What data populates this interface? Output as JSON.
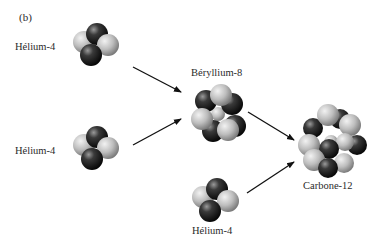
{
  "figure": {
    "panel_label": "(b)"
  },
  "nodes": [
    {
      "id": "he4_a",
      "label": "Hélium-4",
      "protons": 2,
      "neutrons": 2
    },
    {
      "id": "he4_b",
      "label": "Hélium-4",
      "protons": 2,
      "neutrons": 2
    },
    {
      "id": "be8",
      "label": "Béryllium-8",
      "protons": 4,
      "neutrons": 4
    },
    {
      "id": "he4_c",
      "label": "Hélium-4",
      "protons": 2,
      "neutrons": 2
    },
    {
      "id": "c12",
      "label": "Carbone-12",
      "protons": 6,
      "neutrons": 6
    }
  ],
  "edges": [
    {
      "from": "he4_a",
      "to": "be8"
    },
    {
      "from": "he4_b",
      "to": "be8"
    },
    {
      "from": "be8",
      "to": "c12"
    },
    {
      "from": "he4_c",
      "to": "c12"
    }
  ],
  "colors": {
    "proton_light": "#c8c8c8",
    "neutron_dark": "#1e1e1e",
    "arrow": "#111111",
    "text": "#2a2a2a"
  }
}
